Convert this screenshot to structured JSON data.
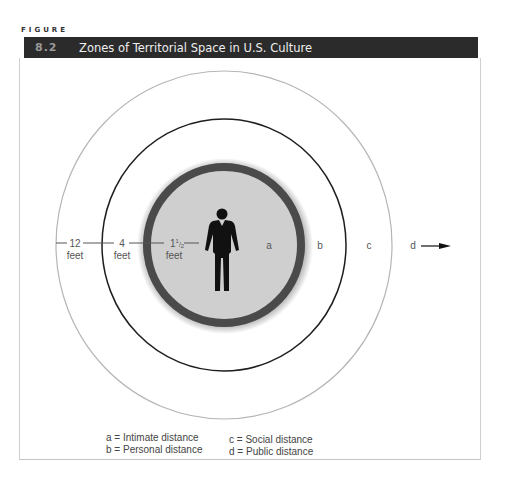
{
  "figure": {
    "label": "FIGURE",
    "number": "8.2",
    "title": "Zones of Territorial Space in U.S. Culture"
  },
  "diagram": {
    "zones": [
      {
        "key": "a",
        "name": "Intimate distance",
        "boundary": "1½ feet"
      },
      {
        "key": "b",
        "name": "Personal distance",
        "boundary": "4 feet"
      },
      {
        "key": "c",
        "name": "Social distance",
        "boundary": "12 feet"
      },
      {
        "key": "d",
        "name": "Public distance",
        "boundary": null
      }
    ],
    "distance_labels": {
      "d12": {
        "value": "12",
        "unit": "feet"
      },
      "d4": {
        "value": "4",
        "unit": "feet"
      },
      "d1_5": {
        "value_whole": "1",
        "value_frac_num": "1",
        "value_frac_den": "2",
        "unit": "feet"
      }
    },
    "zone_letters": {
      "a": "a",
      "b": "b",
      "c": "c",
      "d": "d"
    },
    "center_icon": "person-icon",
    "arrow_icon": "arrow-right-icon",
    "colors": {
      "inner_fill": "#cfcfcf",
      "inner_ring": "#4a4a4a",
      "middle_circle": "#1e1e1e",
      "outer_circle": "#b5b5b5",
      "title_bar": "#2b2b2b"
    }
  },
  "legend": {
    "col1": [
      "a = Intimate distance",
      "b = Personal distance"
    ],
    "col2": [
      "c = Social distance",
      "d = Public distance"
    ]
  }
}
